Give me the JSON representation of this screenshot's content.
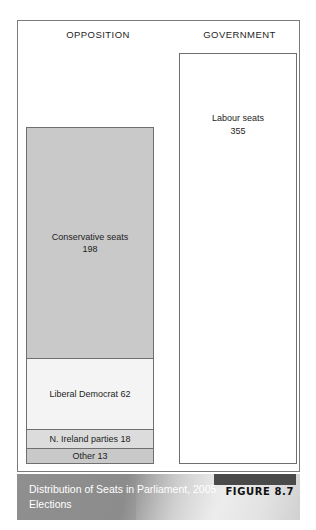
{
  "figure": {
    "headings": {
      "opposition": "OPPOSITION",
      "government": "GOVERNMENT"
    },
    "caption": {
      "title": "Distribution of Seats in Parliament, 2005 Elections",
      "figure_label": "FIGURE 8.7"
    }
  },
  "chart_data": {
    "type": "bar",
    "title": "Distribution of Seats in Parliament, 2005 Elections",
    "subtitle": "FIGURE 8.7",
    "xlabel": "",
    "ylabel": "Seats",
    "grid": false,
    "legend": "none",
    "columns": [
      "OPPOSITION",
      "GOVERNMENT"
    ],
    "categories": [
      "Conservative seats",
      "Liberal Democrat",
      "N. Ireland parties",
      "Other",
      "Labour seats"
    ],
    "values": [
      198,
      62,
      18,
      13,
      355
    ],
    "blocks": [
      {
        "column": "OPPOSITION",
        "name": "Conservative seats",
        "value": 198,
        "label": "Conservative seats",
        "value_label": "198",
        "fill": "#c9c9c9"
      },
      {
        "column": "OPPOSITION",
        "name": "Liberal Democrat",
        "value": 62,
        "label": "Liberal Democrat 62",
        "value_label": "62",
        "fill": "#f4f4f4"
      },
      {
        "column": "OPPOSITION",
        "name": "N. Ireland parties",
        "value": 18,
        "label": "N. Ireland parties 18",
        "value_label": "18",
        "fill": "#dcdcdc"
      },
      {
        "column": "OPPOSITION",
        "name": "Other",
        "value": 13,
        "label": "Other 13",
        "value_label": "13",
        "fill": "#c9c9c9"
      },
      {
        "column": "GOVERNMENT",
        "name": "Labour seats",
        "value": 355,
        "label": "Labour seats",
        "value_label": "355",
        "fill": "#ffffff"
      }
    ],
    "totals": {
      "opposition": 291,
      "government": 355
    }
  }
}
